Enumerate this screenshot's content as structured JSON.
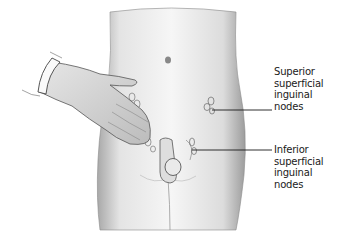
{
  "figure": {
    "colors": {
      "skin_light": "#f2f2f2",
      "skin_shadow": "#9a9a9a",
      "outline": "#555555",
      "line": "#1a1a1a"
    }
  },
  "labels": {
    "superior": {
      "lines": [
        "Superior",
        "superficial",
        "inguinal",
        "nodes"
      ]
    },
    "inferior": {
      "lines": [
        "Inferior",
        "superficial",
        "inguinal",
        "nodes"
      ]
    }
  }
}
